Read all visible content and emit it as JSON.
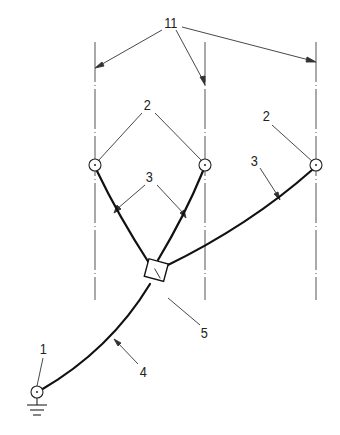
{
  "diagram": {
    "type": "electrical grounding / bonding schematic",
    "labels": {
      "conductors_group": "11",
      "node_left": "2",
      "node_right": "2",
      "branch_left": "3",
      "branch_right": "3",
      "junction": "5",
      "main_lead": "4",
      "ground_terminal": "1"
    },
    "colors": {
      "line": "#222222",
      "centerline": "#555555",
      "background": "#ffffff"
    },
    "elements": [
      {
        "id": "11",
        "description": "three vertical dash-dot reference lines (conductors)"
      },
      {
        "id": "2",
        "description": "circular connection points on each vertical line"
      },
      {
        "id": "3",
        "description": "branch leads from connection points to junction"
      },
      {
        "id": "5",
        "description": "square junction box"
      },
      {
        "id": "4",
        "description": "main lead from junction to ground terminal"
      },
      {
        "id": "1",
        "description": "ground terminal with earth symbol"
      }
    ]
  }
}
